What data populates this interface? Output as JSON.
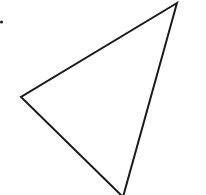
{
  "diagram": {
    "shape": "triangle",
    "stroke_color": "#1a1a1a",
    "fill_color": "none",
    "stroke_width": 2,
    "vertices": [
      {
        "name": "top-right",
        "x": 177,
        "y": 3
      },
      {
        "name": "left",
        "x": 21,
        "y": 97
      },
      {
        "name": "bottom",
        "x": 123,
        "y": 197
      }
    ],
    "dot": {
      "x": 1.5,
      "y": 22,
      "r": 1.5,
      "color": "#1a1a1a"
    }
  }
}
